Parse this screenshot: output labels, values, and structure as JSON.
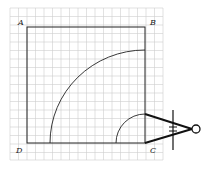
{
  "diagram": {
    "labels": {
      "A": "A",
      "B": "B",
      "C": "C",
      "D": "D"
    },
    "grid": {
      "x0": 10,
      "y0": 8,
      "x1": 163,
      "y1": 160,
      "cell": 8.5,
      "color": "#c8c8c8"
    },
    "square": {
      "A": [
        27,
        27
      ],
      "B": [
        145,
        27
      ],
      "C": [
        145,
        143
      ],
      "D": [
        27,
        143
      ]
    },
    "arcs": [
      {
        "name": "large-arc",
        "center": "C",
        "radius": 96
      },
      {
        "name": "small-arc",
        "center": "C",
        "radius": 29
      }
    ],
    "tool": "compass-icon"
  }
}
